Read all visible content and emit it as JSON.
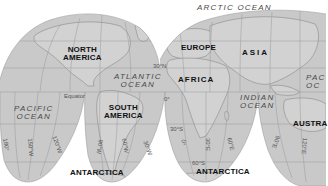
{
  "map": {
    "title": "",
    "projection": "interrupted homolosine",
    "colors": {
      "land_ocean_fill": "#c9c9c9",
      "background": "#ffffff",
      "gridline": "#9a9a9a",
      "coast": "#8a8a8a",
      "continent_label": "#111111",
      "ocean_label": "#4a4a4a"
    },
    "continents": [
      {
        "id": "north-america",
        "line1": "NORTH",
        "line2": "AMERICA"
      },
      {
        "id": "south-america",
        "line1": "SOUTH",
        "line2": "AMERICA"
      },
      {
        "id": "europe",
        "line1": "EUROPE"
      },
      {
        "id": "asia",
        "line1": "ASIA"
      },
      {
        "id": "africa",
        "line1": "AFRICA"
      },
      {
        "id": "australia",
        "line1": "AUSTRA"
      },
      {
        "id": "antarctica-west",
        "line1": "ANTARCTICA"
      },
      {
        "id": "antarctica-east",
        "line1": "ANTARCTICA"
      }
    ],
    "oceans": [
      {
        "id": "arctic",
        "line1": "ARCTIC OCEAN"
      },
      {
        "id": "atlantic",
        "line1": "ATLANTIC",
        "line2": "OCEAN"
      },
      {
        "id": "pacific-west",
        "line1": "PACIFIC",
        "line2": "OCEAN"
      },
      {
        "id": "indian",
        "line1": "INDIAN",
        "line2": "OCEAN"
      },
      {
        "id": "pacific-east",
        "line1": "PAC",
        "line2": "OC"
      }
    ],
    "grid_labels": {
      "equator": "Equator",
      "lat_30n": "30°N",
      "lat_30s": "30°S",
      "lat_60s": "60°S",
      "lon_0_equator": "0°",
      "lon_180": "180°",
      "lon_150w": "150°W",
      "lon_120w": "120°W",
      "lon_90w": "90°W",
      "lon_60w": "60°W",
      "lon_30w": "30°W",
      "lon_0": "0°",
      "lon_30e": "30°E",
      "lon_60e": "60°E",
      "lon_90e": "90°E",
      "lon_120e": "120°E"
    }
  }
}
